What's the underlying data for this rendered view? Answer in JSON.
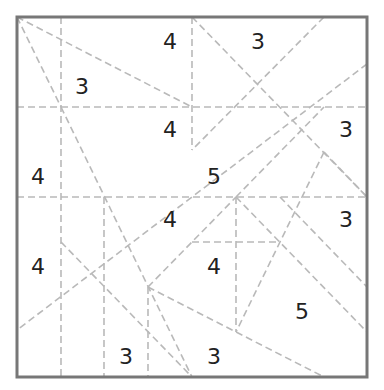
{
  "puzzle": {
    "frame": {
      "x1": 17,
      "y1": 17,
      "x2": 367,
      "y2": 377,
      "color": "#777777"
    },
    "line_color": "#b9b9b9",
    "dashed_lines": [
      [
        17,
        107,
        367,
        107
      ],
      [
        17,
        197,
        367,
        197
      ],
      [
        61,
        17,
        61,
        377
      ],
      [
        192,
        17,
        192,
        150
      ],
      [
        104,
        197,
        104,
        377
      ],
      [
        148,
        287,
        148,
        377
      ],
      [
        236,
        197,
        236,
        332
      ],
      [
        192,
        242,
        280,
        242
      ],
      [
        17,
        17,
        192,
        107
      ],
      [
        17,
        17,
        61,
        107
      ],
      [
        61,
        107,
        192,
        377
      ],
      [
        192,
        17,
        367,
        197
      ],
      [
        324,
        17,
        192,
        150
      ],
      [
        367,
        64,
        17,
        330
      ],
      [
        61,
        242,
        192,
        377
      ],
      [
        148,
        287,
        324,
        377
      ],
      [
        148,
        287,
        236,
        197
      ],
      [
        236,
        197,
        324,
        107
      ],
      [
        236,
        197,
        367,
        332
      ],
      [
        280,
        197,
        367,
        287
      ],
      [
        324,
        152,
        236,
        332
      ],
      [
        324,
        152,
        367,
        197
      ]
    ],
    "clues": [
      {
        "value": "4",
        "x": 170,
        "y": 42
      },
      {
        "value": "3",
        "x": 258,
        "y": 42
      },
      {
        "value": "3",
        "x": 82,
        "y": 87
      },
      {
        "value": "4",
        "x": 170,
        "y": 130
      },
      {
        "value": "3",
        "x": 346,
        "y": 130
      },
      {
        "value": "4",
        "x": 38,
        "y": 177
      },
      {
        "value": "5",
        "x": 214,
        "y": 177
      },
      {
        "value": "4",
        "x": 170,
        "y": 220
      },
      {
        "value": "3",
        "x": 346,
        "y": 220
      },
      {
        "value": "4",
        "x": 38,
        "y": 267
      },
      {
        "value": "4",
        "x": 214,
        "y": 267
      },
      {
        "value": "5",
        "x": 302,
        "y": 312
      },
      {
        "value": "3",
        "x": 126,
        "y": 357
      },
      {
        "value": "3",
        "x": 214,
        "y": 357
      }
    ]
  }
}
